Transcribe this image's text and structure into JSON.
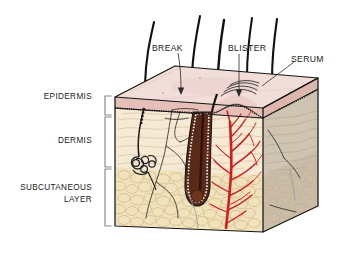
{
  "figure": {
    "type": "anatomical-diagram"
  },
  "layer_labels": [
    {
      "id": "epidermis",
      "text": "EPIDERMIS",
      "line2": ""
    },
    {
      "id": "dermis",
      "text": "DERMIS",
      "line2": ""
    },
    {
      "id": "subcutaneous",
      "text": "SUBCUTANEOUS",
      "line2": "LAYER"
    }
  ],
  "callouts": [
    {
      "id": "break",
      "text": "BREAK"
    },
    {
      "id": "blister",
      "text": "BLISTER"
    },
    {
      "id": "serum",
      "text": "SERUM"
    }
  ],
  "colors": {
    "epidermis_face": "#e6c0b8",
    "epidermis_top": "#f1ded9",
    "dermis_face": "#f6ead4",
    "dermis_side": "#cfc3b2",
    "subcutaneous_face": "#f0e2bd",
    "subcutaneous_side": "#c9bda9",
    "vessel_red": "#cf1f1f",
    "follicle_brown": "#5a2a18",
    "outline_black": "#141414",
    "bracket_gray": "#8a8a8a",
    "background": "#ffffff"
  },
  "structures": [
    {
      "id": "hair-shaft",
      "count": 5
    },
    {
      "id": "hair-follicle",
      "count": 1
    },
    {
      "id": "sweat-gland",
      "count": 1
    },
    {
      "id": "blood-vessel-tree",
      "count": 1
    },
    {
      "id": "nerve-fiber",
      "count": 3
    },
    {
      "id": "blister-dome",
      "count": 1
    },
    {
      "id": "serum-arcs",
      "count": 4
    }
  ]
}
